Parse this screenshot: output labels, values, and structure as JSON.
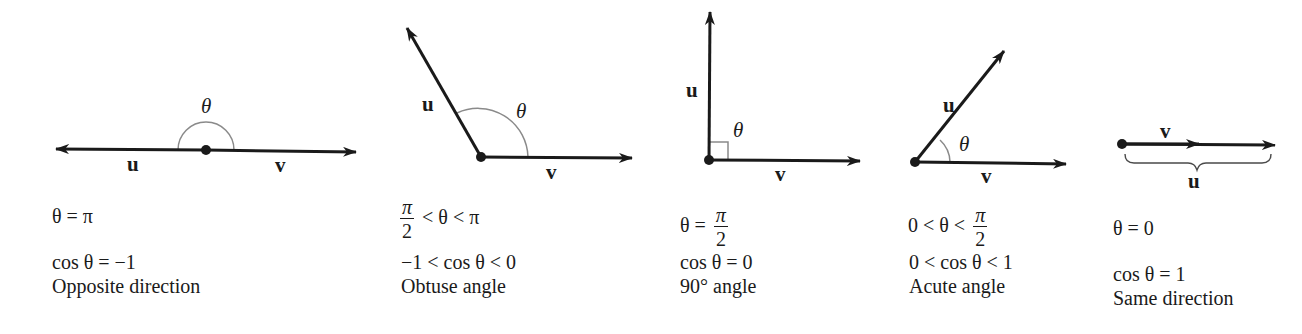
{
  "figure": {
    "colors": {
      "vector": "#1a1a1a",
      "arc": "#8a8a8a",
      "text": "#1a1a1a"
    },
    "panels": [
      {
        "id": "opposite",
        "vector_u_label": "u",
        "vector_v_label": "v",
        "angle_label": "θ",
        "angle_condition": "θ = π",
        "cosine_condition": "cos θ = −1",
        "description": "Opposite direction"
      },
      {
        "id": "obtuse",
        "vector_u_label": "u",
        "vector_v_label": "v",
        "angle_label": "θ",
        "angle_condition": {
          "frac_num": "π",
          "frac_den": "2",
          "rest": "< θ < π"
        },
        "cosine_condition": "−1 < cos θ < 0",
        "description": "Obtuse angle"
      },
      {
        "id": "right",
        "vector_u_label": "u",
        "vector_v_label": "v",
        "angle_label": "θ",
        "angle_condition": {
          "prefix": "θ =",
          "frac_num": "π",
          "frac_den": "2"
        },
        "cosine_condition": "cos θ = 0",
        "description": "90° angle"
      },
      {
        "id": "acute",
        "vector_u_label": "u",
        "vector_v_label": "v",
        "angle_label": "θ",
        "angle_condition": {
          "prefix": "0 < θ <",
          "frac_num": "π",
          "frac_den": "2"
        },
        "cosine_condition": "0 < cos θ < 1",
        "description": "Acute angle"
      },
      {
        "id": "same",
        "vector_u_label": "u",
        "vector_v_label": "v",
        "angle_condition": "θ = 0",
        "cosine_condition": "cos θ = 1",
        "description": "Same direction"
      }
    ]
  }
}
